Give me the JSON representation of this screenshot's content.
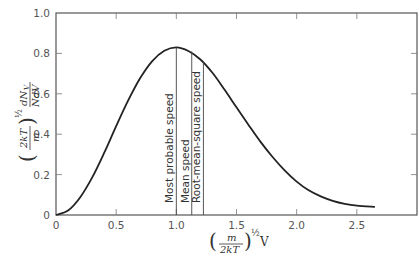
{
  "chart_data": {
    "type": "line",
    "title": "",
    "xlabel": "(m/2kT)^½ V",
    "ylabel": "(2kT/m)^½ dN_V / N dV",
    "xlim": [
      0,
      3.0
    ],
    "ylim": [
      0,
      1.0
    ],
    "grid": false,
    "legend": null,
    "x_ticks": [
      0,
      0.5,
      1.0,
      1.5,
      2.0,
      2.5
    ],
    "x_tick_labels": [
      "0",
      "0.5",
      "1.0",
      "1.5",
      "2.0",
      "2.5"
    ],
    "y_ticks": [
      0,
      0.2,
      0.4,
      0.6,
      0.8,
      1.0
    ],
    "y_tick_labels": [
      "0",
      "0.2",
      "0.4",
      "0.6",
      "0.8",
      "1.0"
    ],
    "series": [
      {
        "name": "Maxwell speed distribution",
        "x": [
          0,
          0.1,
          0.2,
          0.3,
          0.4,
          0.5,
          0.6,
          0.7,
          0.8,
          0.9,
          1.0,
          1.1,
          1.2,
          1.3,
          1.4,
          1.5,
          1.6,
          1.7,
          1.8,
          1.9,
          2.0,
          2.1,
          2.2,
          2.3,
          2.4,
          2.5,
          2.65
        ],
        "y": [
          0,
          0.022,
          0.087,
          0.185,
          0.307,
          0.44,
          0.567,
          0.678,
          0.762,
          0.813,
          0.83,
          0.812,
          0.77,
          0.704,
          0.621,
          0.533,
          0.446,
          0.362,
          0.287,
          0.221,
          0.165,
          0.122,
          0.092,
          0.07,
          0.055,
          0.046,
          0.04
        ]
      }
    ],
    "annotations": [
      {
        "label": "Most probable speed",
        "x": 1.0,
        "y_top": 0.83
      },
      {
        "label": "Mean speed",
        "x": 1.128,
        "y_top": 0.81
      },
      {
        "label": "Root-mean-square speed",
        "x": 1.225,
        "y_top": 0.76
      }
    ]
  },
  "labels": {
    "origin_y": "0",
    "x_axis": {
      "frac_num": "m",
      "frac_den": "2kT",
      "exponent": "½",
      "var": "V"
    },
    "y_axis": {
      "frac_num": "2kT",
      "frac_den": "m",
      "exponent": "½",
      "num": "dN",
      "num_sub": "V",
      "den": "NdV"
    }
  }
}
